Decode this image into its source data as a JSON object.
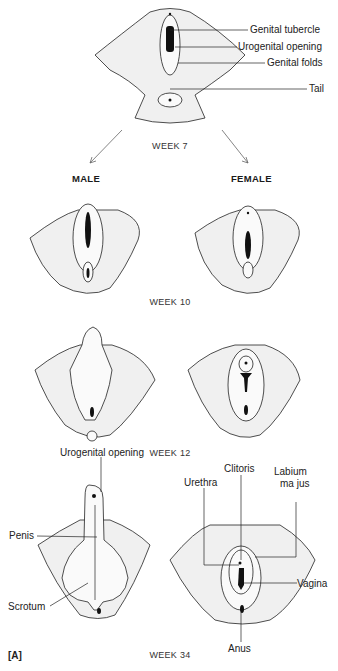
{
  "figure": {
    "panel_label": "[A]",
    "stages": [
      {
        "week": "WEEK 7"
      },
      {
        "week": "WEEK 10"
      },
      {
        "week": "WEEK 12"
      },
      {
        "week": "WEEK 34"
      }
    ],
    "columns": {
      "male": "MALE",
      "female": "FEMALE"
    },
    "week7_labels": {
      "genital_tubercle": "Genital tubercle",
      "urogenital_opening": "Urogenital opening",
      "genital_folds": "Genital folds",
      "tail": "Tail"
    },
    "week34_male_labels": {
      "urogenital_opening": "Urogenital opening",
      "penis": "Penis",
      "scrotum": "Scrotum"
    },
    "week34_female_labels": {
      "clitoris": "Clitoris",
      "urethra": "Urethra",
      "labium_majus_line1": "Labium",
      "labium_majus_line2": "ma jus",
      "vagina": "Vagina",
      "anus": "Anus"
    }
  }
}
